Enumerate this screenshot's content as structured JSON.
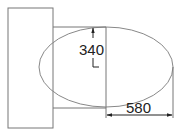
{
  "diagram": {
    "type": "technical-drawing",
    "shapes": {
      "rectangle": {
        "x": 8,
        "y": 8,
        "width": 45,
        "height": 120
      },
      "ellipse": {
        "cx": 106,
        "cy": 67,
        "rx": 67,
        "ry": 40
      }
    },
    "dimensions": {
      "vertical": {
        "label": "340",
        "description": "semi-minor axis"
      },
      "horizontal": {
        "label": "580",
        "description": "semi-major axis"
      }
    },
    "colors": {
      "stroke": "#777777",
      "dim_line": "#333333",
      "text": "#222222",
      "background": "#ffffff"
    }
  }
}
